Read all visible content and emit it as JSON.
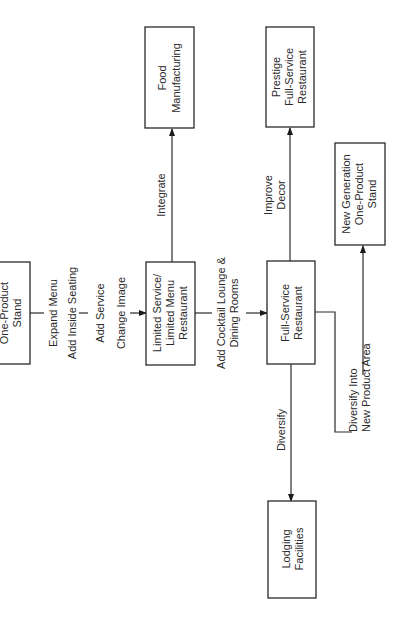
{
  "diagram": {
    "orientation": "rotated-90-ccw",
    "nodes": {
      "one_product_stand": {
        "line1": "One-Product",
        "line2": "Stand"
      },
      "limited_service": {
        "line1": "Limited Service/",
        "line2": "Limited Menu",
        "line3": "Restaurant"
      },
      "full_service": {
        "line1": "Full-Service",
        "line2": "Restaurant"
      },
      "food_manufacturing": {
        "line1": "Food",
        "line2": "Manufacturing"
      },
      "prestige": {
        "line1": "Prestige",
        "line2": "Full-Service",
        "line3": "Restaurant"
      },
      "new_generation": {
        "line1": "New Generation",
        "line2": "One-Product",
        "line3": "Stand"
      },
      "lodging": {
        "line1": "Lodging",
        "line2": "Facilities"
      }
    },
    "edges": {
      "stand_to_limited": {
        "label1": "Expand Menu",
        "label2": "Add Inside Seating",
        "label3": "Add Service",
        "label4": "Change Image"
      },
      "limited_to_full": {
        "label1": "Add Cocktail Lounge &",
        "label2": "Dining Rooms"
      },
      "limited_to_food": {
        "label1": "Integrate"
      },
      "full_to_prestige": {
        "label1": "Improve",
        "label2": "Decor"
      },
      "full_to_lodging": {
        "label1": "Diversify"
      },
      "full_to_new_gen": {
        "label1": "Diversify Into",
        "label2": "New Product Area"
      }
    }
  }
}
